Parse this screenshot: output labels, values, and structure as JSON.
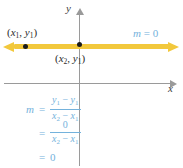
{
  "figure": {
    "axes": {
      "x_label": "x",
      "y_label": "y"
    },
    "line": {
      "slope_label_variable": "m",
      "slope_label_equals": "=",
      "slope_label_value": "0",
      "color": "#f2c83c"
    },
    "points": [
      {
        "name": "point-1",
        "open_paren": "(",
        "x_var": "x",
        "x_sub": "1",
        "comma": ", ",
        "y_var": "y",
        "y_sub": "1",
        "close_paren": ")"
      },
      {
        "name": "point-2",
        "open_paren": "(",
        "x_var": "x",
        "x_sub": "2",
        "comma": ", ",
        "y_var": "y",
        "y_sub": "1",
        "close_paren": ")"
      }
    ],
    "work": {
      "lead": "m",
      "equals": "=",
      "row1": {
        "numerator_left_var": "y",
        "numerator_left_sub": "1",
        "numerator_minus": " − ",
        "numerator_right_var": "y",
        "numerator_right_sub": "1",
        "denominator_left_var": "x",
        "denominator_left_sub": "2",
        "denominator_minus": " − ",
        "denominator_right_var": "x",
        "denominator_right_sub": "1"
      },
      "row2": {
        "numerator": "0",
        "denominator_left_var": "x",
        "denominator_left_sub": "2",
        "denominator_minus": " − ",
        "denominator_right_var": "x",
        "denominator_right_sub": "1"
      },
      "row3": {
        "value": "0"
      }
    },
    "colors": {
      "line": "#f2c83c",
      "annotation": "#74b2dc",
      "axis": "#9a9a9a",
      "point": "#1b1b1b",
      "background": "#ffffff"
    }
  }
}
